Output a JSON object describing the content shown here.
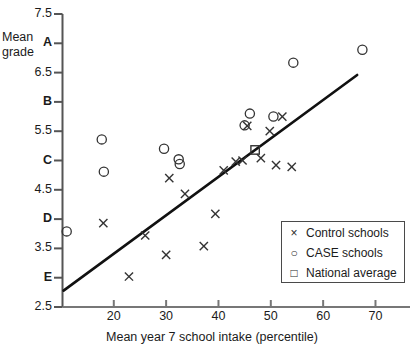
{
  "chart_data": {
    "type": "scatter",
    "title": "",
    "xlabel": "Mean year 7 school intake (percentile)",
    "ylabel": "Mean grade",
    "xlim": [
      10.2,
      76.5
    ],
    "ylim": [
      2.5,
      7.5
    ],
    "grid": false,
    "legend_position": "bottom-right",
    "xticks": [
      20,
      30,
      40,
      50,
      60,
      70
    ],
    "yticks": [
      {
        "value": 7.5,
        "label": "7.5",
        "bold": false
      },
      {
        "value": 7.0,
        "label": "A",
        "bold": true
      },
      {
        "value": 6.5,
        "label": "6.5",
        "bold": false
      },
      {
        "value": 6.0,
        "label": "B",
        "bold": true
      },
      {
        "value": 5.5,
        "label": "5.5",
        "bold": false
      },
      {
        "value": 5.0,
        "label": "C",
        "bold": true
      },
      {
        "value": 4.5,
        "label": "4.5",
        "bold": false
      },
      {
        "value": 4.0,
        "label": "D",
        "bold": true
      },
      {
        "value": 3.5,
        "label": "3.5",
        "bold": false
      },
      {
        "value": 3.0,
        "label": "E",
        "bold": true
      },
      {
        "value": 2.5,
        "label": "2.5",
        "bold": false
      }
    ],
    "series": [
      {
        "name": "Control schools",
        "marker": "x",
        "color": "#333333",
        "points": [
          {
            "x": 18.0,
            "y": 3.93
          },
          {
            "x": 22.9,
            "y": 3.02
          },
          {
            "x": 26.0,
            "y": 3.72
          },
          {
            "x": 30.0,
            "y": 3.39
          },
          {
            "x": 30.6,
            "y": 4.7
          },
          {
            "x": 33.6,
            "y": 4.43
          },
          {
            "x": 37.2,
            "y": 3.54
          },
          {
            "x": 39.4,
            "y": 4.09
          },
          {
            "x": 41.0,
            "y": 4.83
          },
          {
            "x": 43.3,
            "y": 4.98
          },
          {
            "x": 44.6,
            "y": 5.0
          },
          {
            "x": 45.5,
            "y": 5.59
          },
          {
            "x": 48.1,
            "y": 5.04
          },
          {
            "x": 49.8,
            "y": 5.5
          },
          {
            "x": 51.0,
            "y": 4.92
          },
          {
            "x": 52.2,
            "y": 5.75
          },
          {
            "x": 54.0,
            "y": 4.89
          }
        ]
      },
      {
        "name": "CASE schools",
        "marker": "o",
        "color": "#333333",
        "points": [
          {
            "x": 11.0,
            "y": 3.79
          },
          {
            "x": 17.7,
            "y": 5.36
          },
          {
            "x": 18.1,
            "y": 4.81
          },
          {
            "x": 29.6,
            "y": 5.2
          },
          {
            "x": 32.4,
            "y": 5.02
          },
          {
            "x": 32.6,
            "y": 4.94
          },
          {
            "x": 45.0,
            "y": 5.6
          },
          {
            "x": 46.0,
            "y": 5.8
          },
          {
            "x": 50.5,
            "y": 5.75
          },
          {
            "x": 54.3,
            "y": 6.67
          },
          {
            "x": 67.5,
            "y": 6.89
          }
        ]
      },
      {
        "name": "National average",
        "marker": "s",
        "color": "#333333",
        "points": [
          {
            "x": 47.0,
            "y": 5.18
          }
        ]
      }
    ],
    "trendline": {
      "name": "regression line",
      "x_start": 10.4,
      "y_start": 2.78,
      "x_end": 66.5,
      "y_end": 6.46,
      "color": "#111111"
    }
  },
  "legend": {
    "items": [
      {
        "marker": "×",
        "label": "Control schools"
      },
      {
        "marker": "○",
        "label": "CASE schools"
      },
      {
        "marker": "□",
        "label": "National average"
      }
    ]
  },
  "axis_titles": {
    "y_line1": "Mean",
    "y_line2": "grade",
    "x": "Mean year 7 school intake (percentile)"
  }
}
